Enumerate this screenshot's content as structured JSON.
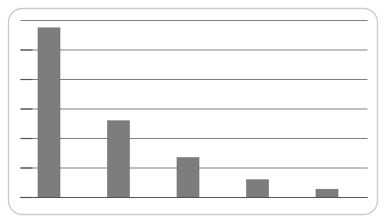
{
  "chart_data": {
    "type": "bar",
    "title": "",
    "subtitle": "",
    "xlabel": "",
    "ylabel": "",
    "categories": [
      "1",
      "2",
      "3",
      "4",
      "5"
    ],
    "values": [
      5.75,
      2.6,
      1.35,
      0.6,
      0.28
    ],
    "ylim": [
      0,
      6
    ],
    "yticks": [
      0,
      1,
      2,
      3,
      4,
      5,
      6
    ],
    "grid": true,
    "grid_axis": "y",
    "legend": false,
    "legend_position": "none",
    "tick_labels_visible": false,
    "axis_labels_visible": false,
    "series": [
      {
        "name": "series-1",
        "values": [
          5.75,
          2.6,
          1.35,
          0.6,
          0.28
        ]
      }
    ],
    "annotations": []
  },
  "style": {
    "bar_color": "#7d7d7d",
    "bar_edge_color": "#6e6e6e",
    "grid_color": "#555555",
    "axis_color": "#555555",
    "frame_color": "#cccccc",
    "background_color": "#ffffff"
  },
  "frame": {
    "label": "rounded-panel",
    "corner_radius": 14
  }
}
